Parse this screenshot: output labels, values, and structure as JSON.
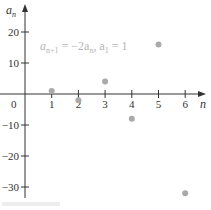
{
  "chart_data": {
    "type": "scatter",
    "title": "",
    "annotation": "a_{n+1} = −2a_n, a_1 = 1",
    "xlabel": "n",
    "ylabel": "a_n",
    "x": [
      1,
      2,
      3,
      4,
      5,
      6
    ],
    "series": [
      {
        "name": "a_n",
        "values": [
          1,
          -2,
          4,
          -8,
          16,
          -32
        ]
      }
    ],
    "x_ticks": [
      0,
      1,
      2,
      3,
      4,
      5,
      6
    ],
    "y_ticks": [
      20,
      10,
      -10,
      -20,
      -30
    ],
    "xlim": [
      0,
      6.5
    ],
    "ylim": [
      -35,
      25
    ],
    "grid": false,
    "legend": "none"
  },
  "labels": {
    "y_axis": "a",
    "y_axis_sub": "n",
    "x_axis": "n",
    "origin": "0",
    "formula_a1": "a",
    "formula_sub1": "n+1",
    "formula_mid": " = −2a",
    "formula_sub2": "n",
    "formula_comma": ", a",
    "formula_sub3": "1",
    "formula_end": " = 1"
  },
  "colors": {
    "points": "#aaaaaa",
    "axis": "#333333",
    "formula": "#b5b5b5"
  }
}
